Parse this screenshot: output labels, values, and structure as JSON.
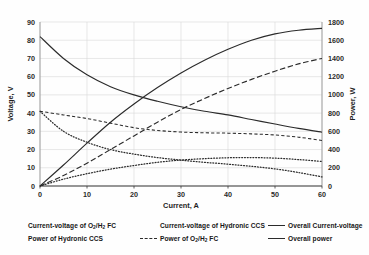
{
  "title_remnant": "",
  "chart_data": {
    "type": "line",
    "title": "",
    "xlabel": "Current, A",
    "ylabel": "Voltage, V",
    "y2label": "Power, W",
    "xlim": [
      0,
      60
    ],
    "xticks": [
      0,
      10,
      20,
      30,
      40,
      50,
      60
    ],
    "ylim": [
      0,
      90
    ],
    "yticks": [
      0,
      10,
      20,
      30,
      40,
      50,
      60,
      70,
      80,
      90
    ],
    "y2lim": [
      0,
      1800
    ],
    "y2ticks": [
      0,
      200,
      400,
      600,
      800,
      1000,
      1200,
      1400,
      1600,
      1800
    ],
    "grid": true,
    "legend_position": "below",
    "x": [
      0,
      5,
      10,
      15,
      20,
      25,
      30,
      35,
      40,
      45,
      50,
      55,
      60
    ],
    "series": [
      {
        "name": "Current-voltage of O2/H2 FC",
        "label_html": "Current-voltage of O<sub>2</sub>/H<sub>2</sub> FC",
        "axis": "left",
        "style": "dashed",
        "values": [
          41.0,
          39.0,
          37.0,
          34.5,
          32.0,
          30.5,
          29.6,
          29.2,
          29.0,
          28.6,
          28.0,
          26.8,
          25.0
        ]
      },
      {
        "name": "Current-voltage of Hydronic CCS",
        "label_html": "Current-voltage of Hydronic CCS",
        "axis": "left",
        "style": "dotted",
        "values": [
          41.0,
          30.0,
          24.0,
          20.0,
          17.5,
          15.6,
          14.2,
          13.0,
          12.0,
          10.8,
          9.4,
          7.4,
          5.0
        ]
      },
      {
        "name": "Overall Current-voltage",
        "label_html": "Overall Current-voltage",
        "axis": "left",
        "style": "solid",
        "values": [
          82.0,
          70.0,
          61.0,
          54.5,
          50.0,
          46.5,
          43.5,
          41.0,
          39.0,
          36.5,
          34.0,
          31.6,
          29.5
        ]
      },
      {
        "name": "Power of Hydronic CCS",
        "label_html": "Power of Hydronic CCS",
        "axis": "right",
        "style": "dotted",
        "values": [
          0,
          75,
          135,
          185,
          225,
          260,
          285,
          300,
          310,
          312,
          306,
          290,
          270
        ]
      },
      {
        "name": "Power of O2/H2 FC",
        "label_html": "Power of O<sub>2</sub>/H<sub>2</sub> FC",
        "axis": "right",
        "style": "longdash",
        "values": [
          0,
          115,
          250,
          400,
          550,
          700,
          840,
          960,
          1070,
          1170,
          1260,
          1340,
          1400
        ]
      },
      {
        "name": "Overall power",
        "label_html": "Overall power",
        "axis": "right",
        "style": "solid",
        "values": [
          0,
          230,
          470,
          700,
          900,
          1080,
          1240,
          1380,
          1500,
          1600,
          1670,
          1710,
          1730
        ]
      }
    ]
  },
  "legend": {
    "columns": [
      [
        {
          "marker": "dashed",
          "label_html": "Current-voltage of O<sub>2</sub>/H<sub>2</sub> FC"
        },
        {
          "marker": "dotted",
          "label_html": "Power of Hydronic CCS"
        }
      ],
      [
        {
          "marker": "dotted",
          "label_html": "Current-voltage of Hydronic CCS"
        },
        {
          "marker": "longdash",
          "label_html": "Power of O<sub>2</sub>/H<sub>2</sub> FC"
        }
      ],
      [
        {
          "marker": "solid",
          "label_html": "Overall Current-voltage"
        },
        {
          "marker": "solid",
          "label_html": "Overall power"
        }
      ]
    ]
  }
}
